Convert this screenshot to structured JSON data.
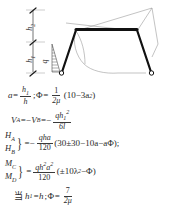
{
  "figure": {
    "name": "pinned-base-trapezoidal-frame",
    "dimensions": {
      "h2_label": "h",
      "h2_sub": "2",
      "h1_label": "h",
      "h1_sub": "1",
      "load_label": "q"
    },
    "colors": {
      "member": "#1a1a1a",
      "diagram": "#8a8a8a",
      "hatch": "#4a4a4a",
      "text": "#2b2b2b"
    }
  },
  "equations": {
    "eq1": {
      "lhs": "a",
      "eq": "=",
      "frac_num": "h",
      "frac_num_sub": "1",
      "frac_den": "h",
      "sep": ";",
      "phi": "Φ",
      "eq2": "=",
      "f2_num": "1",
      "f2_den": "2μ",
      "paren": "(10−3a",
      "exp": "2",
      "paren_close": ")"
    },
    "eq2": {
      "v_a": "V",
      "v_a_sub": "A",
      "eq": "=−",
      "v_b": "V",
      "v_b_sub": "B",
      "eq2": "=−",
      "num": "qh",
      "num_sub": "1",
      "num_exp": "2",
      "den": "6l"
    },
    "eq3": {
      "lhs_top": "H",
      "lhs_top_sub": "A",
      "lhs_bot": "H",
      "lhs_bot_sub": "B",
      "eq": "=−",
      "num": "qha",
      "den": "120",
      "expr": "(30±30−10a−aΦ);"
    },
    "eq4": {
      "lhs_top": "M",
      "lhs_top_sub": "C",
      "lhs_bot": "M",
      "lhs_bot_sub": "D",
      "eq": "=",
      "num": "qh",
      "num_exp": "2",
      "num_a": "a",
      "num_a_exp": "2",
      "den": "120",
      "expr": "(±10λ",
      "expr_sub": "2",
      "expr_tail": "−Φ)"
    },
    "eq5": {
      "cjk": "当",
      "cond": "h",
      "cond_sub": "1",
      "cond_eq": "=h",
      "sep": ";",
      "phi": "Φ",
      "eq": "=",
      "num": "7",
      "den": "2μ"
    }
  }
}
